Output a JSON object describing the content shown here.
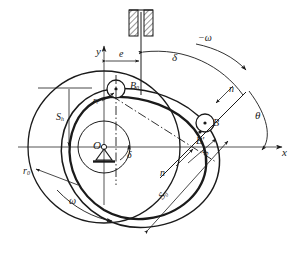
{
  "figure": {
    "type": "cam-mechanism-kinematic-diagram",
    "stroke_color": "#1a1a1a",
    "background_color": "#ffffff"
  },
  "axes": {
    "x_label": "x",
    "y_label": "y",
    "origin_label": "O"
  },
  "points": {
    "b0": "B",
    "b0_sub": "0",
    "b": "B",
    "b_prime": "B′"
  },
  "labels": {
    "offset": "e",
    "roller_radius": "r",
    "roller_radius_sub": "r",
    "base_radius": "r",
    "base_radius_sub": "0",
    "stroke": "S",
    "stroke_sub": "h",
    "displacement_zero": "S",
    "displacement_zero_sub": "0",
    "displacement": "S",
    "normal_upper": "n",
    "normal_lower": "n",
    "angle_delta_top": "δ",
    "angle_delta_origin": "δ",
    "angle_theta": "θ",
    "omega": "ω",
    "omega_negative": "−ω"
  },
  "elements": {
    "guide_block": "hatched-fixed-guide",
    "ground_pivot": "ground-pivot-triangle",
    "base_circle": "base-circle",
    "pitch_curve": "pitch-curve",
    "cam_profile": "cam-profile",
    "roller_b0": "roller-circle-at-B0",
    "roller_b": "roller-circle-at-B"
  }
}
